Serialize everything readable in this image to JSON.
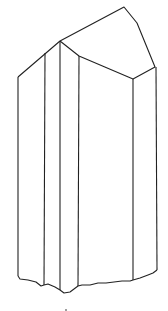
{
  "figure": {
    "stroke_color": "#222222",
    "background": "#ffffff"
  }
}
